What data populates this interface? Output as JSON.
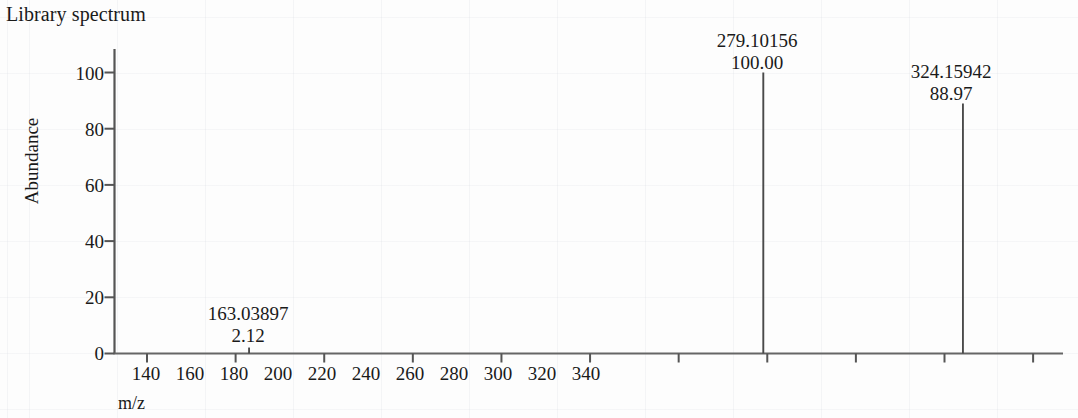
{
  "title": "Library spectrum",
  "axes": {
    "y_label": "Abundance",
    "x_label": "m/z",
    "y_ticks": [
      "0",
      "20",
      "40",
      "60",
      "80",
      "100"
    ],
    "x_ticks": [
      "140",
      "160",
      "180",
      "200",
      "220",
      "240",
      "260",
      "280",
      "300",
      "320",
      "340"
    ]
  },
  "peaks": [
    {
      "mz_label": "163.03897",
      "abundance_label": "2.12"
    },
    {
      "mz_label": "279.10156",
      "abundance_label": "100.00"
    },
    {
      "mz_label": "324.15942",
      "abundance_label": "88.97"
    }
  ],
  "chart_data": {
    "type": "bar",
    "title": "Library spectrum",
    "xlabel": "m/z",
    "ylabel": "Abundance",
    "xlim": [
      130,
      350
    ],
    "ylim": [
      0,
      105
    ],
    "grid": false,
    "x": [
      163.03897,
      279.10156,
      324.15942
    ],
    "values": [
      2.12,
      100.0,
      88.97
    ],
    "labels": [
      "163.03897",
      "279.10156",
      "324.15942"
    ],
    "value_labels": [
      "2.12",
      "100.00",
      "88.97"
    ],
    "x_tick_values": [
      140,
      160,
      180,
      200,
      220,
      240,
      260,
      280,
      300,
      320,
      340
    ],
    "y_tick_values": [
      0,
      20,
      40,
      60,
      80,
      100
    ],
    "legend": null,
    "colors": {
      "line": "#4a4a4a",
      "axis": "#555555",
      "text": "#1a1a1a"
    }
  }
}
